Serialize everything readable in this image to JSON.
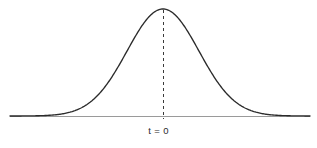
{
  "figure": {
    "width": 317,
    "height": 148,
    "background_color": "#ffffff"
  },
  "style": {
    "curve_color": "#2b2b2b",
    "curve_width": 1.35,
    "axis_color": "#9a9a9a",
    "axis_width": 1.0,
    "dashed_color": "#3a3a3a",
    "dashed_width": 1.0,
    "dash_pattern": "3,3",
    "label_color": "#2b2b2b"
  },
  "labels": {
    "center_tick": "t = 0"
  },
  "geometry": {
    "axis_y": 116,
    "axis_x_start": 10,
    "axis_x_end": 310,
    "center_x": 163,
    "peak_y": 9,
    "dashed_y_top": 10,
    "dashed_y_bottom": 119,
    "sigma_px": 36,
    "label_x": 163,
    "label_y": 126
  },
  "chart_data": {
    "type": "line",
    "title": "",
    "subtitle": "",
    "xlabel": "",
    "ylabel": "",
    "grid": false,
    "legend_position": "none",
    "annotations": [
      {
        "text": "t = 0",
        "x": 0,
        "y": 0,
        "kind": "x-axis-tick-label",
        "marker": "dashed-vertical-line-from-peak-to-axis"
      }
    ],
    "xlabel_ticks": [
      "t = 0"
    ],
    "xlim": [
      -4.25,
      4.083
    ],
    "ylim": [
      0,
      1.0
    ],
    "x": [
      -4.25,
      -4.0,
      -3.75,
      -3.5,
      -3.25,
      -3.0,
      -2.75,
      -2.5,
      -2.25,
      -2.0,
      -1.75,
      -1.5,
      -1.25,
      -1.0,
      -0.75,
      -0.5,
      -0.25,
      0.0,
      0.25,
      0.5,
      0.75,
      1.0,
      1.25,
      1.5,
      1.75,
      2.0,
      2.25,
      2.5,
      2.75,
      3.0,
      3.25,
      3.5,
      3.75,
      4.0,
      4.083
    ],
    "series": [
      {
        "name": "density",
        "values": [
          0.0001,
          0.0003,
          0.0009,
          0.0022,
          0.0051,
          0.0111,
          0.0228,
          0.0439,
          0.0796,
          0.1353,
          0.2163,
          0.3247,
          0.4578,
          0.6065,
          0.7548,
          0.8825,
          0.9692,
          1.0,
          0.9692,
          0.8825,
          0.7548,
          0.6065,
          0.4578,
          0.3247,
          0.2163,
          0.1353,
          0.0796,
          0.0439,
          0.0228,
          0.0111,
          0.0051,
          0.0022,
          0.0009,
          0.0003,
          0.0002
        ]
      }
    ]
  }
}
